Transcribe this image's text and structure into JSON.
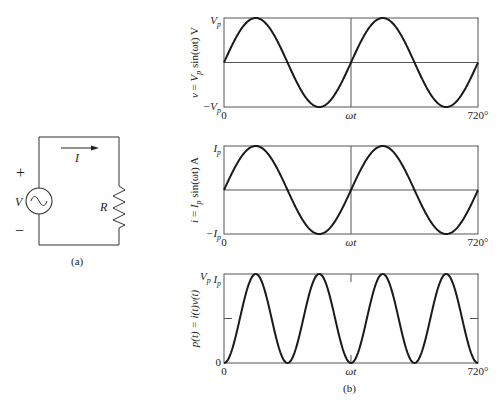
{
  "colors": {
    "ink": "#1a1a1a",
    "grid": "#444444",
    "background": "#ffffff"
  },
  "circuit": {
    "caption": "(a)",
    "source_label": "V",
    "plus_sign": "+",
    "minus_sign": "−",
    "current_label": "I",
    "resistor_label": "R",
    "source_icon": "ac-source-icon"
  },
  "figure_caption": "(b)",
  "chart_data": [
    {
      "type": "line",
      "title": "",
      "ylabel": "v = V_p sin(ωt) V",
      "ylabel_parts": [
        "v = V",
        "p",
        " sin(ωt) V"
      ],
      "xlabel": "ωt",
      "x_ticks": [
        "0",
        "ωt",
        "720°"
      ],
      "y_ticks": [
        "−V_p",
        "V_p"
      ],
      "y_tick_top": "V_p",
      "y_tick_bottom": "−V_p",
      "xlim": [
        0,
        720
      ],
      "ylim": [
        -1,
        1
      ],
      "function": "sin",
      "cycles": 2,
      "series": [
        {
          "name": "v",
          "x": [
            0,
            90,
            180,
            270,
            360,
            450,
            540,
            630,
            720
          ],
          "values": [
            0,
            1,
            0,
            -1,
            0,
            1,
            0,
            -1,
            0
          ]
        }
      ],
      "grid": {
        "horizontal_zero_line": true,
        "vertical_center_line": true
      }
    },
    {
      "type": "line",
      "title": "",
      "ylabel": "i = I_p sin(ωt) A",
      "ylabel_parts": [
        "i = I",
        "p",
        " sin(ωt) A"
      ],
      "xlabel": "ωt",
      "x_ticks": [
        "0",
        "ωt",
        "720°"
      ],
      "y_tick_top": "I_p",
      "y_tick_bottom": "−I_p",
      "xlim": [
        0,
        720
      ],
      "ylim": [
        -1,
        1
      ],
      "function": "sin",
      "cycles": 2,
      "series": [
        {
          "name": "i",
          "x": [
            0,
            90,
            180,
            270,
            360,
            450,
            540,
            630,
            720
          ],
          "values": [
            0,
            1,
            0,
            -1,
            0,
            1,
            0,
            -1,
            0
          ]
        }
      ],
      "grid": {
        "horizontal_zero_line": true,
        "vertical_center_line": true
      }
    },
    {
      "type": "line",
      "title": "",
      "ylabel": "p(t) = i(t)v(t)",
      "xlabel": "ωt",
      "x_ticks": [
        "0",
        "ωt",
        "720°"
      ],
      "y_tick_top": "V_p I_p",
      "y_tick_bottom": "0",
      "xlim": [
        0,
        720
      ],
      "ylim": [
        0,
        1
      ],
      "function": "sin_squared",
      "cycles": 4,
      "series": [
        {
          "name": "p",
          "x": [
            0,
            90,
            180,
            270,
            360,
            450,
            540,
            630,
            720
          ],
          "values": [
            0,
            1,
            0,
            1,
            0,
            1,
            0,
            1,
            0
          ]
        }
      ],
      "grid": {
        "mid_ticks": true,
        "center_ticks": true
      }
    }
  ]
}
